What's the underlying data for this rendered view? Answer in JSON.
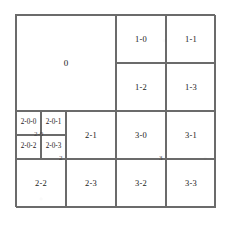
{
  "figure": {
    "type": "quadtree-subdivision-diagram",
    "frame_color": "#6b6b6b",
    "label_color": "#1a1a1a",
    "background_color": "#ffffff"
  },
  "diagram_data": {
    "type": "diagram",
    "root_extent": {
      "x": 0,
      "y": 0,
      "w": 200,
      "h": 193
    },
    "cells": [
      {
        "label": "0",
        "x": 0,
        "y": 0,
        "w": 100,
        "h": 96,
        "depth": 1,
        "size": "big"
      },
      {
        "label": "1-0",
        "x": 100,
        "y": 0,
        "w": 50,
        "h": 48,
        "depth": 2,
        "size": "normal"
      },
      {
        "label": "1-1",
        "x": 150,
        "y": 0,
        "w": 50,
        "h": 48,
        "depth": 2,
        "size": "normal"
      },
      {
        "label": "1-2",
        "x": 100,
        "y": 48,
        "w": 50,
        "h": 48,
        "depth": 2,
        "size": "normal"
      },
      {
        "label": "1-3",
        "x": 150,
        "y": 48,
        "w": 50,
        "h": 48,
        "depth": 2,
        "size": "normal"
      },
      {
        "label": "2-0-0",
        "x": 0,
        "y": 96,
        "w": 25,
        "h": 24,
        "depth": 3,
        "size": "tiny"
      },
      {
        "label": "2-0-1",
        "x": 25,
        "y": 96,
        "w": 25,
        "h": 24,
        "depth": 3,
        "size": "tiny"
      },
      {
        "label": "2-0-2",
        "x": 0,
        "y": 120,
        "w": 25,
        "h": 24,
        "depth": 3,
        "size": "tiny"
      },
      {
        "label": "2-0-3",
        "x": 25,
        "y": 120,
        "w": 25,
        "h": 24,
        "depth": 3,
        "size": "tiny"
      },
      {
        "label": "2-1",
        "x": 50,
        "y": 96,
        "w": 50,
        "h": 48,
        "depth": 2,
        "size": "normal"
      },
      {
        "label": "2-2",
        "x": 0,
        "y": 144,
        "w": 50,
        "h": 49,
        "depth": 2,
        "size": "normal"
      },
      {
        "label": "2-3",
        "x": 50,
        "y": 144,
        "w": 50,
        "h": 49,
        "depth": 2,
        "size": "normal"
      },
      {
        "label": "3-0",
        "x": 100,
        "y": 96,
        "w": 50,
        "h": 48,
        "depth": 2,
        "size": "normal"
      },
      {
        "label": "3-1",
        "x": 150,
        "y": 96,
        "w": 50,
        "h": 48,
        "depth": 2,
        "size": "normal"
      },
      {
        "label": "3-2",
        "x": 100,
        "y": 144,
        "w": 50,
        "h": 49,
        "depth": 2,
        "size": "normal"
      },
      {
        "label": "3-3",
        "x": 150,
        "y": 144,
        "w": 50,
        "h": 49,
        "depth": 2,
        "size": "normal"
      }
    ],
    "node_markers": [
      {
        "label": "2-0",
        "x": 25,
        "y": 120
      },
      {
        "label": "2",
        "x": 50,
        "y": 144
      },
      {
        "label": "3",
        "x": 150,
        "y": 144
      }
    ],
    "labels": {
      "root": "0",
      "quadrant_1": [
        "1-0",
        "1-1",
        "1-2",
        "1-3"
      ],
      "quadrant_2": [
        "2-0",
        "2-1",
        "2-2",
        "2-3"
      ],
      "quadrant_2_0": [
        "2-0-0",
        "2-0-1",
        "2-0-2",
        "2-0-3"
      ],
      "quadrant_3": [
        "3-0",
        "3-1",
        "3-2",
        "3-3"
      ]
    }
  }
}
